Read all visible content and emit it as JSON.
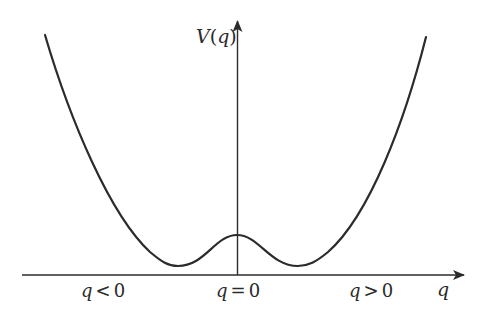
{
  "diagram": {
    "type": "double-well-potential",
    "colors": {
      "stroke": "#2b2b2b",
      "background": "#ffffff"
    },
    "axes": {
      "y_label": "V(q)",
      "y_label_parts": {
        "fn": "V",
        "open": "(",
        "var": "q",
        "close": ")"
      },
      "x_label": "q"
    },
    "region_labels": [
      {
        "var": "q",
        "rel": "<",
        "val": "0",
        "text": "q < 0"
      },
      {
        "var": "q",
        "rel": "=",
        "val": "0",
        "text": "q = 0"
      },
      {
        "var": "q",
        "rel": ">",
        "val": "0",
        "text": "q > 0"
      }
    ],
    "curve": {
      "shape": "quartic double well",
      "features": [
        "left minimum",
        "central local maximum at q = 0",
        "right minimum"
      ]
    }
  }
}
